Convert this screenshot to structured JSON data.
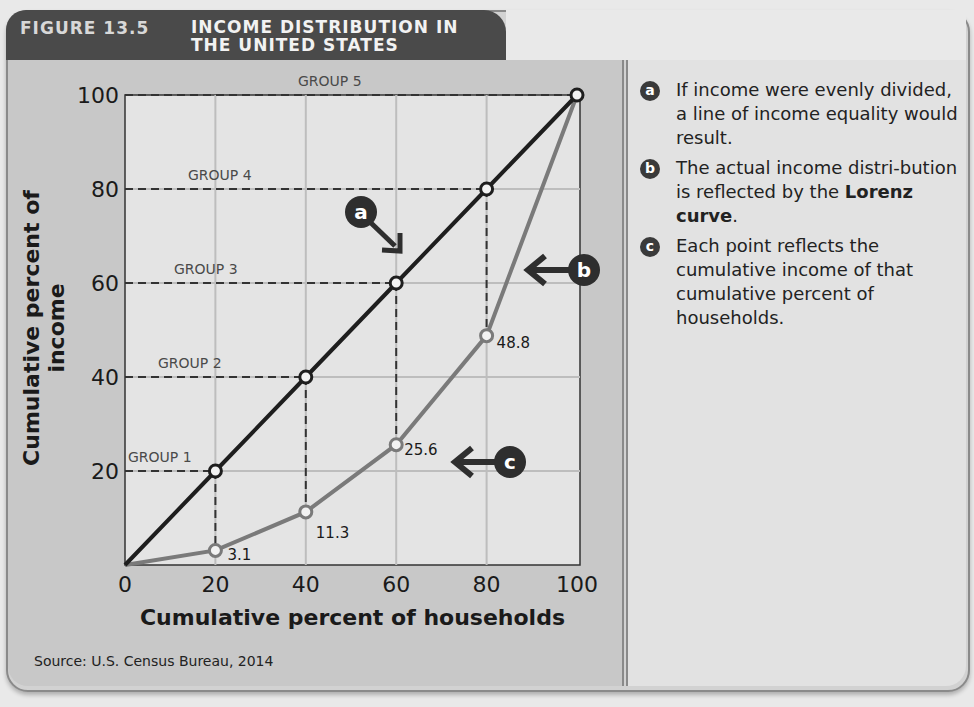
{
  "header": {
    "figure_number": "FIGURE 13.5",
    "title": "INCOME DISTRIBUTION IN\nTHE UNITED STATES"
  },
  "source": "Source: U.S. Census Bureau, 2014",
  "notes": [
    {
      "badge": "a",
      "text": "If income were evenly divided, a line of income equality would result."
    },
    {
      "badge": "b",
      "text_before": "The actual income distri-bution is reflected by the ",
      "bold": "Lorenz curve",
      "text_after": "."
    },
    {
      "badge": "c",
      "text": "Each point reflects the cumulative income of that cumulative percent of households."
    }
  ],
  "colors": {
    "equality_line": "#1e1e1e",
    "lorenz_curve": "#7a7a7a",
    "plot_bg": "#e4e4e4",
    "panel_bg": "#c8c8c8",
    "header_bg": "#4a4a4a"
  },
  "chart_data": {
    "type": "line",
    "title": "INCOME DISTRIBUTION IN THE UNITED STATES",
    "xlabel": "Cumulative percent of households",
    "ylabel": "Cumulative percent of income",
    "xlim": [
      0,
      100
    ],
    "ylim": [
      0,
      100
    ],
    "x_ticks": [
      0,
      20,
      40,
      60,
      80,
      100
    ],
    "y_ticks": [
      20,
      40,
      60,
      80,
      100
    ],
    "grid": true,
    "x": [
      0,
      20,
      40,
      60,
      80,
      100
    ],
    "series": [
      {
        "name": "Line of income equality",
        "values": [
          0,
          20,
          40,
          60,
          80,
          100
        ]
      },
      {
        "name": "Lorenz curve",
        "values": [
          0,
          3.1,
          11.3,
          25.6,
          48.8,
          100
        ]
      }
    ],
    "data_labels": [
      "3.1",
      "11.3",
      "25.6",
      "48.8"
    ],
    "group_labels": [
      "GROUP 1",
      "GROUP 2",
      "GROUP 3",
      "GROUP 4",
      "GROUP 5"
    ],
    "annotations": [
      {
        "marker": "a",
        "points_to": "Line of income equality"
      },
      {
        "marker": "b",
        "points_to": "Lorenz curve"
      },
      {
        "marker": "c",
        "points_to": "Lorenz curve data point (60, 25.6)"
      }
    ]
  }
}
